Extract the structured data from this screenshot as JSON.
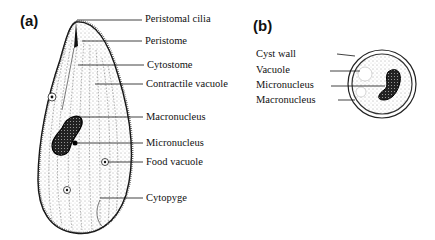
{
  "figure": {
    "panels": [
      {
        "id": "a",
        "label": "(a)",
        "subject": "Balantidium trophozoite",
        "annotations": [
          "Peristomal cilia",
          "Peristome",
          "Cytostome",
          "Contractile vacuole",
          "Macronucleus",
          "Micronucleus",
          "Food vacuole",
          "Cytopyge"
        ]
      },
      {
        "id": "b",
        "label": "(b)",
        "subject": "Cyst",
        "annotations": [
          "Cyst wall",
          "Vacuole",
          "Micronucleus",
          "Macronucleus"
        ]
      }
    ]
  }
}
